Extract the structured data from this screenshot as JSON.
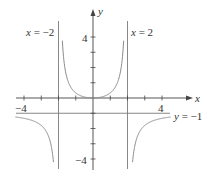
{
  "chart_data": {
    "type": "line",
    "title": "",
    "function": "y = x^2 / (4 - x^2)",
    "xlabel": "x",
    "ylabel": "y",
    "xlim": [
      -4.5,
      5.7
    ],
    "ylim": [
      -4.8,
      5.8
    ],
    "x_ticks": [
      -4,
      -3,
      -2,
      -1,
      1,
      2,
      3,
      4
    ],
    "x_tick_labels": [
      {
        "value": -4,
        "label": "−4"
      },
      {
        "value": 4,
        "label": "4"
      }
    ],
    "y_ticks": [
      -4,
      -3,
      -2,
      -1,
      1,
      2,
      3,
      4
    ],
    "y_tick_labels": [
      {
        "value": 4,
        "label": "4"
      },
      {
        "value": -4,
        "label": "−4"
      }
    ],
    "grid": false,
    "asymptotes": [
      {
        "type": "vertical",
        "value": -2,
        "label_var": "x",
        "label_rest": " = −2"
      },
      {
        "type": "vertical",
        "value": 2,
        "label_var": "x",
        "label_rest": " = 2"
      },
      {
        "type": "horizontal",
        "value": -1,
        "label_var": "y",
        "label_rest": " = −1"
      }
    ],
    "series": [
      {
        "name": "left branch",
        "x_range": [
          -4.5,
          -2.22
        ]
      },
      {
        "name": "center branch",
        "x_range": [
          -1.8,
          1.8
        ]
      },
      {
        "name": "right branch",
        "x_range": [
          2.22,
          4.5
        ]
      }
    ],
    "sample_points": [
      {
        "x": -4,
        "y": -1.33
      },
      {
        "x": -3,
        "y": -1.8
      },
      {
        "x": -2.2,
        "y": -5.76
      },
      {
        "x": -1.8,
        "y": 4.26
      },
      {
        "x": -1,
        "y": 0.33
      },
      {
        "x": 0,
        "y": 0
      },
      {
        "x": 1,
        "y": 0.33
      },
      {
        "x": 1.8,
        "y": 4.26
      },
      {
        "x": 2.2,
        "y": -5.76
      },
      {
        "x": 3,
        "y": -1.8
      },
      {
        "x": 4,
        "y": -1.33
      }
    ]
  },
  "colors": {
    "axis": "#444444",
    "curve": "#8c8c8c",
    "asymptote": "#7a7a7a",
    "text": "#333333"
  }
}
